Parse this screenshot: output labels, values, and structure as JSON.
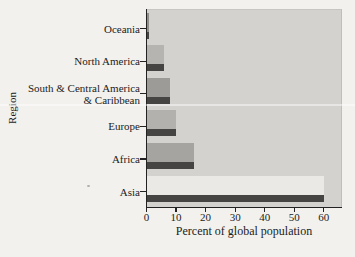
{
  "chart_data": {
    "type": "bar",
    "orientation": "horizontal",
    "title": "",
    "xlabel": "Percent of global population",
    "ylabel": "Region",
    "categories": [
      "Oceania",
      "North America",
      "South & Central America & Caribbean",
      "Europe",
      "Africa",
      "Asia"
    ],
    "category_display": [
      [
        "Oceania"
      ],
      [
        "North America"
      ],
      [
        "South & Central America",
        "& Caribbean"
      ],
      [
        "Europe"
      ],
      [
        "Africa"
      ],
      [
        "Asia"
      ]
    ],
    "values": [
      0.5,
      6,
      8,
      10,
      16,
      60
    ],
    "xlim": [
      0,
      66
    ],
    "xticks": [
      0,
      10,
      20,
      30,
      40,
      50,
      60
    ],
    "grid": false,
    "legend": false,
    "bar_colors": [
      "#8f8e8b",
      "#b5b4b1",
      "#9c9b98",
      "#b2b1ae",
      "#a5a4a1",
      "#eae9e5"
    ],
    "bar_shadow_color": "#454442",
    "plot_bg": "#d3d2cf",
    "page_bg": "#f2f1ee",
    "axis_color": "#222222"
  }
}
